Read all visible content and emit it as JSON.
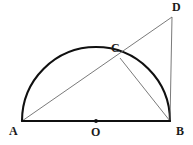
{
  "figure": {
    "background_color": "#ffffff",
    "width": 193,
    "height": 145,
    "labels": {
      "a": "A",
      "b": "B",
      "c": "C",
      "d": "D",
      "o": "O"
    },
    "colors": {
      "arc_stroke": "#101010",
      "diameter_stroke": "#101010",
      "thin_stroke": "#6b6b6b",
      "center_dot": "#101010",
      "label_color": "#1a1a1a"
    },
    "points": {
      "A": {
        "x": 22,
        "y": 121
      },
      "B": {
        "x": 170,
        "y": 121
      },
      "C": {
        "x": 120,
        "y": 58
      },
      "D": {
        "x": 172,
        "y": 17
      },
      "O": {
        "x": 96,
        "y": 121
      }
    },
    "geometry": {
      "circle_center_x": 96,
      "circle_center_y": 121,
      "circle_radius": 74,
      "arc_path": "M 22 121 A 74 74 0 0 1 170 121",
      "segment_AB": {
        "x1": 22,
        "y1": 121,
        "x2": 170,
        "y2": 121
      },
      "segment_AD": {
        "x1": 22,
        "y1": 121,
        "x2": 172,
        "y2": 17
      },
      "segment_BD": {
        "x1": 170,
        "y1": 121,
        "x2": 172,
        "y2": 17
      },
      "segment_CB": {
        "x1": 120,
        "y1": 58,
        "x2": 170,
        "y2": 121
      },
      "center_dot_radius": 1.9
    },
    "stroke_widths": {
      "arc": 2.1,
      "diameter": 2.1,
      "thin": 0.9
    }
  }
}
